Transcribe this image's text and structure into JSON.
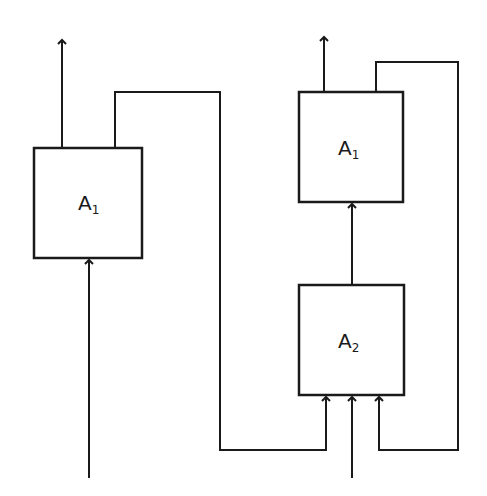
{
  "diagram": {
    "type": "block-diagram",
    "left": {
      "block": {
        "label": "A",
        "subscript": "1",
        "x": 34,
        "y": 148,
        "w": 108,
        "h": 110
      },
      "output_arrow": {
        "x": 62,
        "y1": 148,
        "y2": 38
      },
      "input_arrow": {
        "x": 89,
        "y1": 478,
        "y2": 258
      },
      "feedback_path": "115,148 115,92 220,92 220,450 326,450 326,395"
    },
    "right": {
      "top_block": {
        "label": "A",
        "subscript": "1",
        "x": 299,
        "y": 92,
        "w": 104,
        "h": 110
      },
      "bottom_block": {
        "label": "A",
        "subscript": "2",
        "x": 299,
        "y": 285,
        "w": 105,
        "h": 110
      },
      "output_arrow": {
        "x": 324,
        "y1": 92,
        "y2": 35
      },
      "connect_arrow": {
        "x": 352,
        "y1": 285,
        "y2": 202
      },
      "input_arrow": {
        "x": 352,
        "y1": 478,
        "y2": 395
      },
      "feedback_path": "376,92 376,62 458,62 458,450 379,450 379,395"
    },
    "stroke_color": "#1a1a1a",
    "background": "#ffffff"
  }
}
